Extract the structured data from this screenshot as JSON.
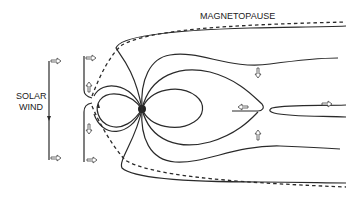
{
  "diagram": {
    "labels": {
      "magnetopause": "MAGNETOPAUSE",
      "solar_wind_line1": "SOLAR",
      "solar_wind_line2": "WIND"
    },
    "elements": {
      "earth": "earth-dot",
      "magnetopause_boundary": "dashed-line",
      "field_lines": "solid-lines",
      "flow_arrows": "hollow-arrows",
      "interplanetary_field": "vertical-field-lines"
    },
    "colors": {
      "line": "#2a2a2a",
      "background": "#ffffff"
    }
  }
}
